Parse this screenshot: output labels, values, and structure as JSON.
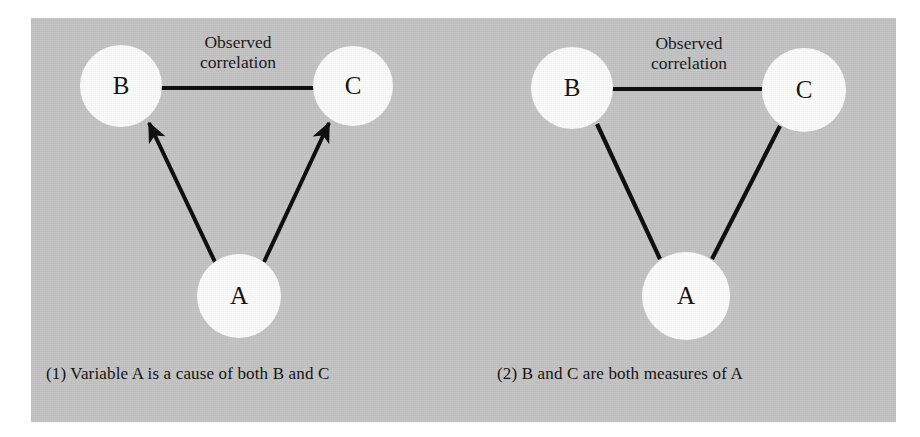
{
  "figure": {
    "background_color": "#ffffff",
    "panel_color": "#c6c6c6",
    "ink_color": "#101010",
    "node_fill_color": "#fdfdfd"
  },
  "panels": [
    {
      "id": "panel-1",
      "caption": "(1)  Variable A is a cause of both B and C",
      "correlation_label_line1": "Observed",
      "correlation_label_line2": "correlation",
      "nodes": [
        {
          "id": "node-b",
          "label": "B",
          "cx": 121,
          "cy": 86,
          "r": 41
        },
        {
          "id": "node-c",
          "label": "C",
          "cx": 353,
          "cy": 86,
          "r": 40
        },
        {
          "id": "node-a",
          "label": "A",
          "cx": 239,
          "cy": 296,
          "r": 42
        }
      ],
      "edges": [
        {
          "id": "edge-b-c",
          "from": "B",
          "to": "C",
          "type": "line",
          "semantic": "observed-correlation"
        },
        {
          "id": "edge-a-b",
          "from": "A",
          "to": "B",
          "type": "arrow",
          "semantic": "causal-arrow"
        },
        {
          "id": "edge-a-c",
          "from": "A",
          "to": "C",
          "type": "arrow",
          "semantic": "causal-arrow"
        }
      ]
    },
    {
      "id": "panel-2",
      "caption": "(2)  B and C are both measures of A",
      "correlation_label_line1": "Observed",
      "correlation_label_line2": "correlation",
      "nodes": [
        {
          "id": "node-b",
          "label": "B",
          "cx": 572,
          "cy": 88,
          "r": 41
        },
        {
          "id": "node-c",
          "label": "C",
          "cx": 804,
          "cy": 90,
          "r": 42
        },
        {
          "id": "node-a",
          "label": "A",
          "cx": 686,
          "cy": 296,
          "r": 44
        }
      ],
      "edges": [
        {
          "id": "edge-b-c",
          "from": "B",
          "to": "C",
          "type": "line",
          "semantic": "observed-correlation"
        },
        {
          "id": "edge-a-b",
          "from": "A",
          "to": "B",
          "type": "line",
          "semantic": "measurement-link"
        },
        {
          "id": "edge-a-c",
          "from": "A",
          "to": "C",
          "type": "line",
          "semantic": "measurement-link"
        }
      ]
    }
  ]
}
